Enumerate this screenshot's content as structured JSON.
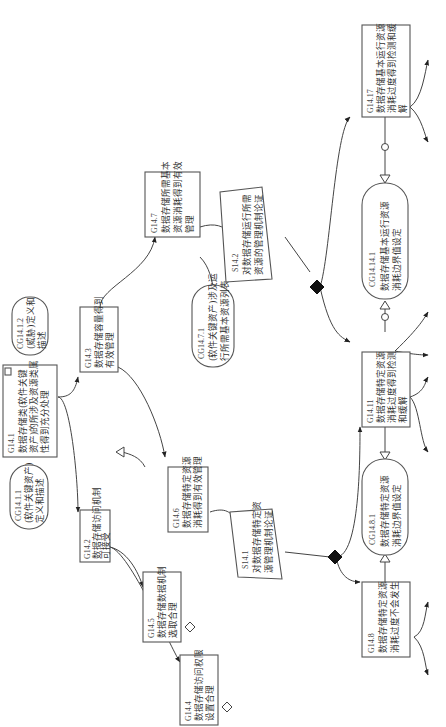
{
  "diagram": {
    "type": "GSN assurance case",
    "orientation": "rotated 90 degrees counter-clockwise",
    "colors": {
      "line": "#444444",
      "box_border": "#555555",
      "text": "#333333",
      "solution_fill": "#111111"
    },
    "goals": {
      "G14_1": {
        "id": "G14.1",
        "lines": [
          "数据存储类(软件关键",
          "资产)的所涉及资源类属",
          "性得到充分处理"
        ]
      },
      "G14_2": {
        "id": "G14.2",
        "lines": [
          "数据存储访问机制",
          "可接受"
        ]
      },
      "G14_3": {
        "id": "G14.3",
        "lines": [
          "数据存储容量得到",
          "有效管理"
        ]
      },
      "G14_4": {
        "id": "G14.4",
        "lines": [
          "数据存储访问权限",
          "设置合理"
        ]
      },
      "G14_5": {
        "id": "G14.5",
        "lines": [
          "数据存储数据机制",
          "选取合理"
        ]
      },
      "G14_6": {
        "id": "G14.6",
        "lines": [
          "数据存储特定资源",
          "消耗得到有效管理"
        ]
      },
      "G14_7": {
        "id": "G14.7",
        "lines": [
          "数据存储所需基本",
          "资源消耗得到有效",
          "管理"
        ]
      },
      "G14_8": {
        "id": "G14.8",
        "lines": [
          "数据存储特定资源",
          "消耗过度不会发生"
        ]
      },
      "G14_9": {
        "id": "G14.9",
        "lines": [
          "数据存储特定资源",
          "使用请求过滤"
        ]
      },
      "G14_10": {
        "id": "G14.10",
        "lines": [
          "数据存储特定资源",
          "使用调度策略正确"
        ]
      },
      "G14_11": {
        "id": "G14.11",
        "lines": [
          "数据存储特定资源",
          "消耗过度得到检测",
          "和缓解"
        ]
      },
      "G14_12": {
        "id": "G14.12",
        "lines": [
          "数据存储设置特定",
          "资源消耗监控机制"
        ]
      },
      "G14_13": {
        "id": "G14.13",
        "lines": [
          "数据存储特定资源",
          "消耗过载处理机制",
          "正确"
        ]
      },
      "G14_14": {
        "id": "G14.14",
        "lines": [
          "数据存储基本运行",
          "资源消耗过度不会",
          "发生"
        ]
      },
      "G14_15": {
        "id": "G14.15",
        "lines": [
          "数据存储基本运行",
          "资源使用请求过滤"
        ]
      },
      "G14_16": {
        "id": "G14.16",
        "lines": [
          "数据存储基本运行",
          "资源使用调度策略",
          "正确"
        ]
      },
      "G14_17": {
        "id": "G14.17",
        "lines": [
          "数据存储基本运行资源",
          "消耗过度得到检测和缓",
          "解"
        ]
      },
      "G14_18": {
        "id": "G14.18",
        "lines": [
          "数据存储基本运行",
          "资源消耗监控机制"
        ]
      },
      "G14_19": {
        "id": "G14.19",
        "lines": [
          "数据存储基本运行",
          "资源消耗过载处理",
          "机制正确"
        ]
      }
    },
    "contexts": {
      "CG14_1_1": {
        "id": "CG14.1.1",
        "lines": [
          "(软件关键资产)",
          "定义和描述"
        ]
      },
      "CG14_1_2": {
        "id": "CG14.1.2",
        "lines": [
          "(威胁)定义和",
          "描述"
        ]
      },
      "CG14_6_1": {
        "id": "CG14.6.1",
        "lines": [
          "(软件关键资产)涉及",
          "特定资源列表"
        ]
      },
      "CG14_7_1": {
        "id": "CG14.7.1",
        "lines": [
          "(软件关键资产)涉及运",
          "行所需基本资源列表"
        ]
      },
      "CG14_8_1": {
        "id": "CG14.8.1",
        "lines": [
          "数据存储特定资源",
          "消耗边界值设定"
        ]
      },
      "CG14_14_1": {
        "id": "CG14.14.1",
        "lines": [
          "数据存储基本运行资源",
          "消耗边界值设定"
        ]
      }
    },
    "strategies": {
      "S14_1": {
        "id": "S14.1",
        "lines": [
          "对数据存储特定资",
          "源管理机制论证"
        ]
      },
      "S14_2": {
        "id": "S14.2",
        "lines": [
          "对数据存储运行所需",
          "资源的管理机制论证"
        ]
      }
    }
  }
}
